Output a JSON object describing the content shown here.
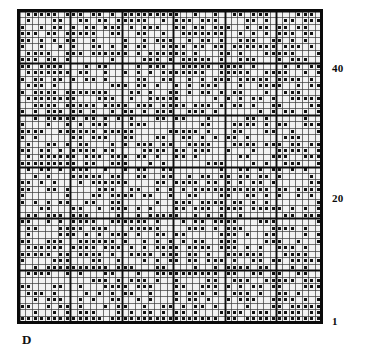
{
  "figure": {
    "panel_label": "D",
    "type": "matrix-grid-plot",
    "background_color": "#ffffff",
    "ink_color": "#111111",
    "cell_fill_color": "#f2f2f2",
    "grid_line_color": "#3a3a3a",
    "block_line_color": "#0d0d0d",
    "border_color": "#0a0a0a"
  },
  "axis": {
    "position": "right",
    "ticks": [
      {
        "label": "40",
        "value": 40
      },
      {
        "label": "20",
        "value": 20
      },
      {
        "label": "1",
        "value": 1
      }
    ],
    "range": [
      1,
      48
    ],
    "direction": "bottom-to-top"
  },
  "chart_data": {
    "type": "heatmap",
    "title": "",
    "xlabel": "",
    "ylabel": "",
    "grid": true,
    "legend": "none",
    "rows": 48,
    "cols": 47,
    "block_size": 8,
    "xlim": [
      1,
      47
    ],
    "ylim": [
      1,
      48
    ],
    "tick_labels_y": [
      "40",
      "20",
      "1"
    ],
    "tick_values_y": [
      40,
      20,
      1
    ],
    "marker": "filled-square-dot",
    "fill_density": 0.55,
    "seed": 20240817
  }
}
